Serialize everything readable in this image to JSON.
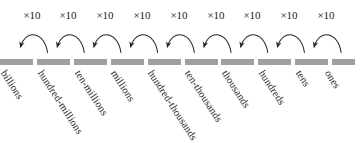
{
  "diagram": {
    "multiplier_label": "×10",
    "arrow_count": 9,
    "multipliers": [
      "×10",
      "×10",
      "×10",
      "×10",
      "×10",
      "×10",
      "×10",
      "×10",
      "×10"
    ],
    "place_values": [
      "billions",
      "hundred-millions",
      "ten-millions",
      "millions",
      "hundred-thousands",
      "ten-thousands",
      "thousands",
      "hundreds",
      "tens",
      "ones"
    ],
    "colors": {
      "line": "#a0a0a0",
      "text": "#1c1c1c",
      "arrow": "#262626",
      "background": "#ffffff"
    }
  }
}
